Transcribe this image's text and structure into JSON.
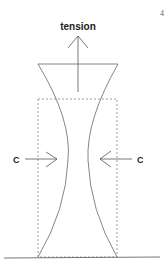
{
  "page_number": "4",
  "labels": {
    "tension": "tension",
    "compression_left": "C",
    "compression_right": "C"
  },
  "colors": {
    "stroke": "#555555",
    "text": "#222222",
    "background": "#ffffff"
  }
}
